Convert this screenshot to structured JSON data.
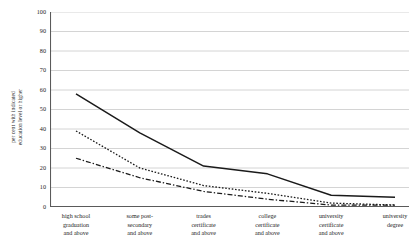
{
  "chart_data": {
    "type": "line",
    "title": "",
    "xlabel": "",
    "ylabel": "per cent with indicated education level or higher",
    "ylabel_lines": [
      "per cent with indicated",
      "education level or higher"
    ],
    "ylim": [
      0,
      100
    ],
    "yticks": [
      0,
      10,
      20,
      30,
      40,
      50,
      60,
      70,
      80,
      90,
      100
    ],
    "ytick_labels": [
      "0",
      "10",
      "20",
      "30",
      "40",
      "50",
      "60",
      "70",
      "80",
      "90",
      "100"
    ],
    "grid": true,
    "legend": "none",
    "categories": [
      "high school graduation and above",
      "some post-secondary and above",
      "trades certificate and above",
      "college certificate and above",
      "university certificate and above",
      "university degree"
    ],
    "category_lines": [
      [
        "high school",
        "graduation",
        "and above"
      ],
      [
        "some post-",
        "secondary",
        "and above"
      ],
      [
        "trades",
        "certificate",
        "and above"
      ],
      [
        "college",
        "certificate",
        "and above"
      ],
      [
        "university",
        "certificate",
        "and above"
      ],
      [
        "university",
        "degree"
      ]
    ],
    "series": [
      {
        "name": "solid-series",
        "style": "solid",
        "color": "#1a1a1a",
        "values": [
          58,
          38,
          21,
          17,
          6,
          5
        ]
      },
      {
        "name": "dotted-series",
        "style": "dotted",
        "color": "#1a1a1a",
        "values": [
          39,
          20,
          11,
          7,
          2,
          1
        ]
      },
      {
        "name": "dash-dot-series",
        "style": "dash-dot",
        "color": "#1a1a1a",
        "values": [
          25,
          15,
          8,
          4,
          1,
          1
        ]
      }
    ]
  },
  "colors": {
    "axis": "#5a5a5a",
    "grid": "#c9c9c9",
    "line": "#1a1a1a",
    "background": "#ffffff",
    "text": "#1c1c1c"
  }
}
